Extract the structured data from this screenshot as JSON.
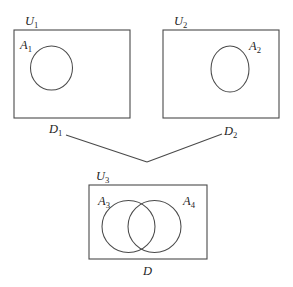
{
  "figure": {
    "title_faint": "",
    "background_color": "#ffffff",
    "stroke_color": "#4a4a4a",
    "text_color": "#1f1f1f"
  },
  "universes": [
    {
      "id": "u1",
      "label_base": "U",
      "label_sub": "1",
      "label_full": "U₁",
      "x": 14,
      "y": 30,
      "width": 116,
      "height": 88,
      "label_x": 25,
      "label_y": 25
    },
    {
      "id": "u2",
      "label_base": "U",
      "label_sub": "2",
      "label_full": "U₂",
      "x": 163,
      "y": 30,
      "width": 116,
      "height": 88,
      "label_x": 174,
      "label_y": 25
    },
    {
      "id": "u3",
      "label_base": "U",
      "label_sub": "3",
      "label_full": "U₃",
      "x": 89,
      "y": 185,
      "width": 118,
      "height": 74,
      "label_x": 96,
      "label_y": 180
    }
  ],
  "sets": [
    {
      "id": "a1",
      "label_base": "A",
      "label_sub": "1",
      "label_full": "A₁",
      "shape": "ellipse",
      "cx": 51.5,
      "cy": 68,
      "rx": 21,
      "ry": 22,
      "label_x": 20,
      "label_y": 49
    },
    {
      "id": "a2",
      "label_base": "A",
      "label_sub": "2",
      "label_full": "A₂",
      "shape": "ellipse",
      "cx": 230,
      "cy": 69,
      "rx": 19,
      "ry": 23,
      "label_x": 249,
      "label_y": 50
    },
    {
      "id": "a3",
      "label_base": "A",
      "label_sub": "3",
      "label_full": "A₃",
      "shape": "circle",
      "cx": 128.5,
      "cy": 226.5,
      "rx": 26.5,
      "ry": 26,
      "label_x": 98,
      "label_y": 205
    },
    {
      "id": "a4",
      "label_base": "A",
      "label_sub": "4",
      "label_full": "A₄",
      "shape": "circle",
      "cx": 154.5,
      "cy": 226.5,
      "rx": 26.5,
      "ry": 26,
      "label_x": 183,
      "label_y": 205
    }
  ],
  "connectors": [
    {
      "id": "d1",
      "label_base": "D",
      "label_sub": "1",
      "label_full": "D₁",
      "label_x": 49,
      "label_y": 133,
      "path": "M 66 135 L 147 162"
    },
    {
      "id": "d2",
      "label_base": "D",
      "label_sub": "2",
      "label_full": "D₂",
      "label_x": 224,
      "label_y": 135,
      "path": "M 147 162 L 222 134"
    }
  ],
  "result": {
    "id": "d",
    "label_base": "D",
    "label_sub": "",
    "label_full": "D",
    "label_x": 143,
    "label_y": 275
  }
}
